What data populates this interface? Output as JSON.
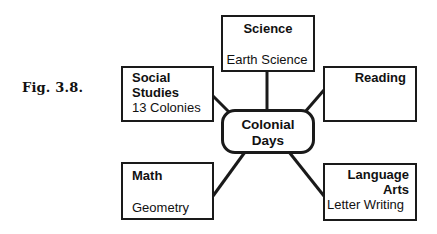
{
  "figure": {
    "label": "Fig. 3.8."
  },
  "center": {
    "line1": "Colonial",
    "line2": "Days"
  },
  "nodes": {
    "science": {
      "title": "Science",
      "subtitle": "Earth Science"
    },
    "social_studies": {
      "title_line1": "Social",
      "title_line2": "Studies",
      "subtitle": "13 Colonies"
    },
    "reading": {
      "title": "Reading",
      "subtitle": ""
    },
    "math": {
      "title": "Math",
      "subtitle": "Geometry"
    },
    "language_arts": {
      "title_line1": "Language",
      "title_line2": "Arts",
      "subtitle": "Letter Writing"
    }
  },
  "colors": {
    "stroke": "#1a1a1a",
    "background": "#ffffff"
  }
}
